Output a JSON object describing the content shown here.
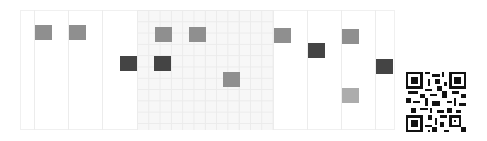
{
  "board": {
    "columns_x": [
      34,
      68,
      102,
      137,
      171,
      205,
      239,
      273,
      307,
      341,
      375
    ],
    "tinted_region": {
      "left": 137,
      "right": 273
    },
    "colors": {
      "line": "#ececec",
      "tint": "#f7f7f7",
      "medium": "#8f8f8f",
      "dark": "#444444",
      "light": "#acacac"
    },
    "squares": [
      {
        "x": 35,
        "y": 25,
        "tone": "medium"
      },
      {
        "x": 69,
        "y": 25,
        "tone": "medium"
      },
      {
        "x": 120,
        "y": 56,
        "tone": "dark"
      },
      {
        "x": 155,
        "y": 27,
        "tone": "medium"
      },
      {
        "x": 154,
        "y": 56,
        "tone": "dark"
      },
      {
        "x": 189,
        "y": 27,
        "tone": "medium"
      },
      {
        "x": 223,
        "y": 72,
        "tone": "medium"
      },
      {
        "x": 274,
        "y": 28,
        "tone": "medium"
      },
      {
        "x": 308,
        "y": 43,
        "tone": "dark"
      },
      {
        "x": 342,
        "y": 29,
        "tone": "medium"
      },
      {
        "x": 376,
        "y": 59,
        "tone": "dark"
      },
      {
        "x": 342,
        "y": 88,
        "tone": "light"
      }
    ]
  },
  "qr_code": {
    "x": 406,
    "y": 72,
    "size": 60,
    "label": "QR code"
  }
}
